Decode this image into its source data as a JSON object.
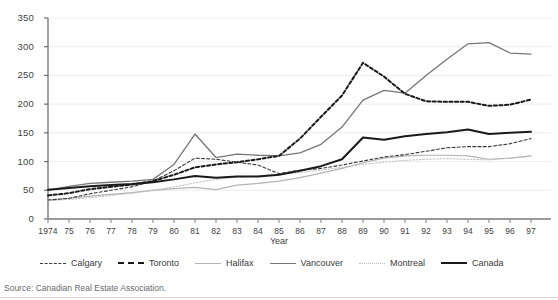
{
  "chart_data": {
    "type": "line",
    "title": "",
    "xlabel": "Year",
    "ylabel": "",
    "grid": true,
    "legend_position": "bottom",
    "xlim": [
      1974,
      1997
    ],
    "ylim": [
      0,
      350
    ],
    "ytick_step": 50,
    "yticks": [
      "0",
      "50",
      "100",
      "150",
      "200",
      "250",
      "300",
      "350"
    ],
    "x": [
      1974,
      1975,
      1976,
      1977,
      1978,
      1979,
      1980,
      1981,
      1982,
      1983,
      1984,
      1985,
      1986,
      1987,
      1988,
      1989,
      1990,
      1991,
      1992,
      1993,
      1994,
      1995,
      1996,
      1997
    ],
    "categories": [
      "1974",
      "75",
      "76",
      "77",
      "78",
      "79",
      "80",
      "81",
      "82",
      "83",
      "84",
      "85",
      "86",
      "87",
      "88",
      "89",
      "90",
      "91",
      "92",
      "93",
      "94",
      "95",
      "96",
      "97"
    ],
    "series": [
      {
        "name": "Calgary",
        "style": "dashed-thin",
        "color": "#3a3a3a",
        "values": [
          33,
          36,
          44,
          50,
          56,
          66,
          84,
          106,
          104,
          99,
          94,
          79,
          85,
          88,
          94,
          101,
          108,
          112,
          118,
          124,
          126,
          126,
          131,
          140
        ]
      },
      {
        "name": "Toronto",
        "style": "dashed-bold",
        "color": "#1a1a1a",
        "values": [
          41,
          45,
          52,
          56,
          60,
          66,
          77,
          90,
          95,
          99,
          104,
          110,
          140,
          178,
          215,
          272,
          248,
          218,
          205,
          204,
          204,
          197,
          199,
          208
        ]
      },
      {
        "name": "Halifax",
        "style": "solid-light",
        "color": "#b3b3b3",
        "values": [
          33,
          36,
          40,
          43,
          46,
          50,
          53,
          55,
          51,
          59,
          62,
          66,
          72,
          80,
          88,
          98,
          106,
          110,
          111,
          111,
          110,
          104,
          106,
          110
        ]
      },
      {
        "name": "Vancouver",
        "style": "solid-medium",
        "color": "#767676",
        "values": [
          50,
          57,
          62,
          64,
          66,
          69,
          95,
          148,
          107,
          113,
          111,
          110,
          115,
          130,
          160,
          207,
          224,
          219,
          250,
          278,
          305,
          307,
          289,
          287
        ]
      },
      {
        "name": "Montreal",
        "style": "dotted-light",
        "color": "#c0c0c0",
        "values": [
          32,
          34,
          37,
          41,
          45,
          50,
          56,
          63,
          69,
          73,
          75,
          78,
          81,
          85,
          90,
          95,
          99,
          102,
          104,
          105,
          104,
          103,
          106,
          109
        ]
      },
      {
        "name": "Canada",
        "style": "solid-bold",
        "color": "#1a1a1a",
        "values": [
          51,
          54,
          57,
          59,
          61,
          64,
          69,
          75,
          72,
          74,
          74,
          77,
          84,
          92,
          104,
          142,
          138,
          144,
          148,
          151,
          156,
          148,
          150,
          152
        ]
      }
    ]
  },
  "axis": {
    "x_title": "Year"
  },
  "legend": {
    "items": [
      {
        "label": "Calgary"
      },
      {
        "label": "Toronto"
      },
      {
        "label": "Halifax"
      },
      {
        "label": "Vancouver"
      },
      {
        "label": "Montreal"
      },
      {
        "label": "Canada"
      }
    ]
  },
  "source": {
    "text": "Source: Canadian Real Estate Association."
  }
}
